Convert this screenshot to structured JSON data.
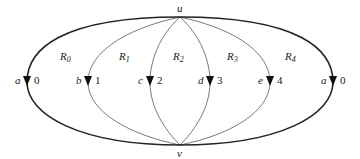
{
  "diagram": {
    "vertices": {
      "top": {
        "label": "u"
      },
      "bottom": {
        "label": "v"
      }
    },
    "regions": [
      {
        "letter": "R",
        "index": "0"
      },
      {
        "letter": "R",
        "index": "1"
      },
      {
        "letter": "R",
        "index": "2"
      },
      {
        "letter": "R",
        "index": "3"
      },
      {
        "letter": "R",
        "index": "4"
      }
    ],
    "edges": [
      {
        "name": "a",
        "value": "0"
      },
      {
        "name": "b",
        "value": "1"
      },
      {
        "name": "c",
        "value": "2"
      },
      {
        "name": "d",
        "value": "3"
      },
      {
        "name": "e",
        "value": "4"
      },
      {
        "name": "a",
        "value": "0"
      }
    ]
  }
}
